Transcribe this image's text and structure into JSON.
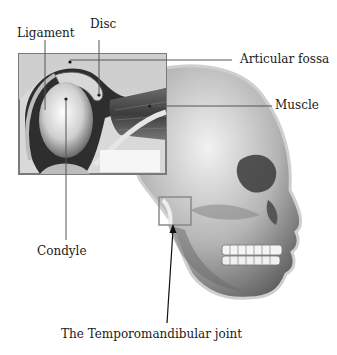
{
  "diagram": {
    "title": "The Temporomandibular joint",
    "labels": {
      "ligament": "Ligament",
      "disc": "Disc",
      "articular_fossa": "Articular fossa",
      "muscle": "Muscle",
      "condyle": "Condyle",
      "tmj": "The Temporomandibular joint"
    },
    "colors": {
      "background": "#ffffff",
      "text": "#1a1a1a",
      "leader_line": "#555555",
      "bone_light": "#e6e6e6",
      "bone_mid": "#a8a8a8",
      "bone_dark": "#3a3a3a"
    }
  }
}
